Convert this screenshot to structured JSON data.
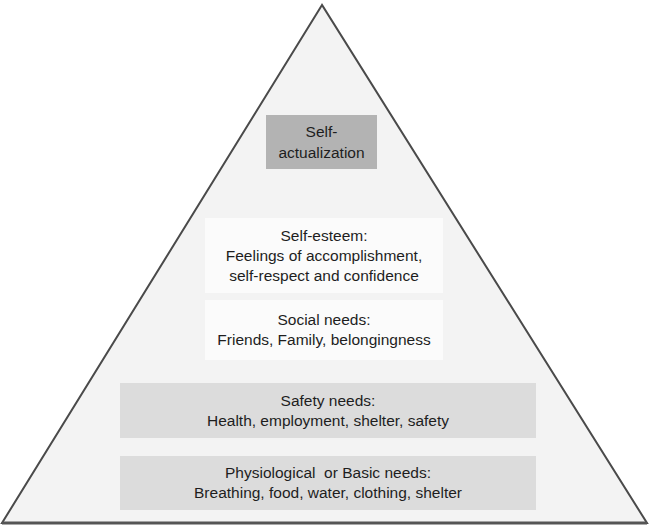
{
  "diagram": {
    "type": "pyramid",
    "colors": {
      "outline": "#4a4a4a",
      "fill": "#f3f3f3",
      "top_box": "#b3b3b3",
      "middle_box": "#fbfbfb",
      "bottom_box": "#dcdcdc",
      "text": "#1e1e1e"
    },
    "levels": [
      {
        "title": "Self-",
        "subtitle": "actualization"
      },
      {
        "title": "Self-esteem:",
        "line2": "Feelings of accomplishment,",
        "line3": "self-respect and confidence"
      },
      {
        "title": "Social needs:",
        "line2": "Friends, Family, belongingness"
      },
      {
        "title": "Safety needs:",
        "line2": "Health, employment, shelter, safety"
      },
      {
        "title": "Physiological  or Basic needs:",
        "line2": "Breathing, food, water, clothing, shelter"
      }
    ]
  }
}
